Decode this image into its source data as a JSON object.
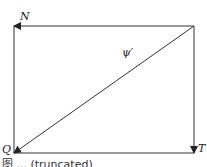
{
  "diagram": {
    "type": "vector-triangle",
    "labels": {
      "N": "N",
      "Q": "Q",
      "T": "T",
      "psi": "ψ′"
    },
    "caption": "图 ... (truncated)",
    "colors": {
      "line": "#333333",
      "background": "#ffffff"
    },
    "rect": {
      "left": 14,
      "top": 26,
      "right": 194,
      "bottom": 153
    },
    "arrows": [
      {
        "name": "top-edge-arrow",
        "from": "top-right",
        "to": "top-left",
        "label": "N"
      },
      {
        "name": "right-edge-arrow",
        "from": "top-right",
        "to": "bottom-right",
        "label": "T"
      },
      {
        "name": "diagonal-arrow",
        "from": "top-right",
        "to": "bottom-left",
        "label": "ψ′"
      }
    ]
  }
}
